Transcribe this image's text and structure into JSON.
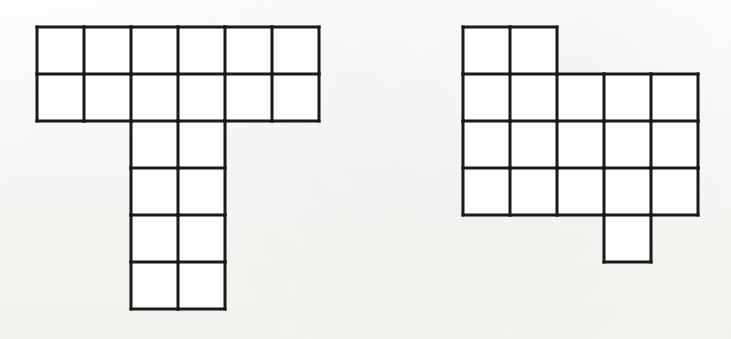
{
  "page": {
    "background_color": "#fdfdfc",
    "stroke_color": "#1a1a1a",
    "cell_fill_color": "#ffffff",
    "width": 731,
    "height": 339,
    "stroke_width": 3,
    "cell_size": 47
  },
  "figures": [
    {
      "id": "left-figure",
      "name": "t-shaped-polyomino",
      "description": "T-shaped grid of unit squares",
      "origin": {
        "x": 37,
        "y": 27
      },
      "cell_size": 47,
      "columns": 6,
      "rows": 6,
      "cell_count": 20,
      "cells": [
        [
          0,
          0
        ],
        [
          1,
          0
        ],
        [
          2,
          0
        ],
        [
          3,
          0
        ],
        [
          4,
          0
        ],
        [
          5,
          0
        ],
        [
          0,
          1
        ],
        [
          1,
          1
        ],
        [
          2,
          1
        ],
        [
          3,
          1
        ],
        [
          4,
          1
        ],
        [
          5,
          1
        ],
        [
          2,
          2
        ],
        [
          3,
          2
        ],
        [
          2,
          3
        ],
        [
          3,
          3
        ],
        [
          2,
          4
        ],
        [
          3,
          4
        ],
        [
          2,
          5
        ],
        [
          3,
          5
        ]
      ]
    },
    {
      "id": "right-figure",
      "name": "irregular-polyomino",
      "description": "Irregular staircase grid of unit squares",
      "origin": {
        "x": 463,
        "y": 27
      },
      "cell_size": 47,
      "columns": 5,
      "rows": 5,
      "cell_count": 18,
      "cells": [
        [
          0,
          0
        ],
        [
          1,
          0
        ],
        [
          0,
          1
        ],
        [
          1,
          1
        ],
        [
          2,
          1
        ],
        [
          3,
          1
        ],
        [
          4,
          1
        ],
        [
          0,
          2
        ],
        [
          1,
          2
        ],
        [
          2,
          2
        ],
        [
          3,
          2
        ],
        [
          4,
          2
        ],
        [
          0,
          3
        ],
        [
          1,
          3
        ],
        [
          2,
          3
        ],
        [
          3,
          3
        ],
        [
          4,
          3
        ],
        [
          3,
          4
        ]
      ]
    }
  ],
  "ghost_marks": [
    {
      "text": "",
      "x": 250,
      "y": 290,
      "size": 15
    }
  ]
}
